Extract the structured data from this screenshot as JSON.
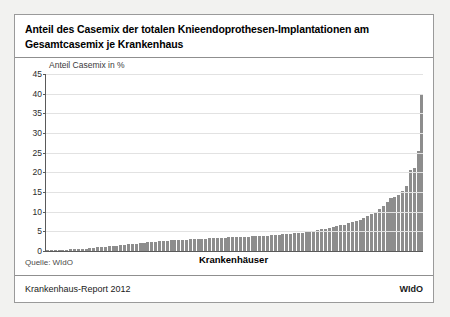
{
  "header": {
    "title": "Anteil des Casemix der totalen Knieendoprothesen-Implantationen am Gesamtcasemix je Krankenhaus"
  },
  "footer": {
    "source_label": "Quelle: WIdO",
    "report_label": "Krankenhaus-Report 2012",
    "logo_label": "WIdO"
  },
  "chart_data": {
    "type": "bar",
    "title": "Anteil des Casemix der totalen Knieendoprothesen-Implantationen am Gesamtcasemix je Krankenhaus",
    "xlabel": "Krankenhäuser",
    "ylabel": "Anteil Casemix in %",
    "ylim": [
      0,
      45
    ],
    "yticks": [
      0,
      5,
      10,
      15,
      20,
      25,
      30,
      35,
      40,
      45
    ],
    "grid": "horizontal",
    "legend": "none",
    "bar_color": "#8d8d8d",
    "sorted": "ascending",
    "categories": [
      "1",
      "2",
      "3",
      "4",
      "5",
      "6",
      "7",
      "8",
      "9",
      "10",
      "11",
      "12",
      "13",
      "14",
      "15",
      "16",
      "17",
      "18",
      "19",
      "20",
      "21",
      "22",
      "23",
      "24",
      "25",
      "26",
      "27",
      "28",
      "29",
      "30",
      "31",
      "32",
      "33",
      "34",
      "35",
      "36",
      "37",
      "38",
      "39",
      "40",
      "41",
      "42",
      "43",
      "44",
      "45",
      "46",
      "47",
      "48",
      "49",
      "50",
      "51",
      "52",
      "53",
      "54",
      "55",
      "56",
      "57",
      "58",
      "59",
      "60",
      "61",
      "62",
      "63",
      "64",
      "65",
      "66",
      "67",
      "68",
      "69",
      "70",
      "71",
      "72",
      "73",
      "74",
      "75",
      "76",
      "77",
      "78",
      "79",
      "80",
      "81",
      "82",
      "83",
      "84",
      "85",
      "86",
      "87",
      "88",
      "89",
      "90",
      "91",
      "92",
      "93",
      "94",
      "95",
      "96",
      "97",
      "98"
    ],
    "values": [
      0.1,
      0.15,
      0.2,
      0.25,
      0.3,
      0.35,
      0.4,
      0.45,
      0.5,
      0.55,
      0.6,
      0.7,
      0.8,
      0.9,
      1.0,
      1.1,
      1.2,
      1.3,
      1.4,
      1.5,
      1.6,
      1.7,
      1.8,
      1.9,
      2.0,
      2.1,
      2.2,
      2.3,
      2.4,
      2.5,
      2.6,
      2.65,
      2.7,
      2.75,
      2.8,
      2.85,
      2.9,
      2.95,
      3.0,
      3.05,
      3.1,
      3.15,
      3.2,
      3.25,
      3.3,
      3.35,
      3.4,
      3.45,
      3.5,
      3.55,
      3.6,
      3.6,
      3.65,
      3.7,
      3.75,
      3.8,
      3.85,
      3.9,
      3.95,
      4.0,
      4.1,
      4.2,
      4.3,
      4.4,
      4.5,
      4.6,
      4.7,
      4.8,
      4.9,
      5.1,
      5.3,
      5.5,
      5.7,
      5.9,
      6.1,
      6.3,
      6.5,
      6.7,
      7.0,
      7.3,
      7.6,
      8.0,
      8.4,
      8.8,
      9.3,
      10.0,
      10.8,
      11.5,
      12.5,
      13.5,
      13.8,
      14.2,
      15.2,
      16.5,
      20.5,
      21.0,
      25.5,
      40.0
    ]
  }
}
